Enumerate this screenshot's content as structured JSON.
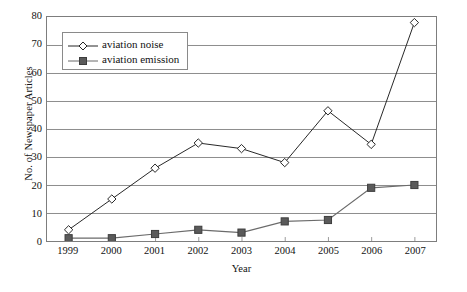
{
  "chart_data": {
    "type": "line",
    "title": "",
    "xlabel": "Year",
    "ylabel": "No. of Newspaper Articles",
    "categories": [
      "1999",
      "2000",
      "2001",
      "2002",
      "2003",
      "2004",
      "2005",
      "2006",
      "2007"
    ],
    "x": [
      1999,
      2000,
      2001,
      2002,
      2003,
      2004,
      2005,
      2006,
      2007
    ],
    "ylim": [
      0,
      80
    ],
    "yticks": [
      0,
      10,
      20,
      30,
      40,
      50,
      60,
      70,
      80
    ],
    "grid": "horizontal",
    "legend_position": "upper-left-inside",
    "series": [
      {
        "name": "aviation noise",
        "marker": "diamond-open",
        "color": "#262626",
        "values": [
          4,
          15,
          26,
          35,
          33,
          28,
          46.5,
          34.5,
          78
        ]
      },
      {
        "name": "aviation emission",
        "marker": "square-filled",
        "color": "#6b6b6b",
        "values": [
          1,
          1,
          2.5,
          4,
          3,
          7,
          7.5,
          19,
          20
        ]
      }
    ]
  },
  "axes": {
    "y_title": "No. of Newspaper Articles",
    "x_title": "Year",
    "y_ticklabels": [
      "0",
      "10",
      "20",
      "30",
      "40",
      "50",
      "60",
      "70",
      "80"
    ],
    "x_ticklabels": [
      "1999",
      "2000",
      "2001",
      "2002",
      "2003",
      "2004",
      "2005",
      "2006",
      "2007"
    ]
  },
  "legend": {
    "items": [
      {
        "label": "aviation noise",
        "marker": "diamond-open"
      },
      {
        "label": "aviation emission",
        "marker": "square-filled"
      }
    ]
  },
  "colors": {
    "series_noise": "#262626",
    "series_emission": "#6b6b6b",
    "gridline": "#8c8c8c",
    "frame": "#7d7d7d",
    "text": "#111111",
    "background": "#ffffff"
  }
}
